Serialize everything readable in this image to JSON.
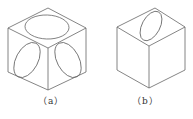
{
  "figure": {
    "panels": [
      {
        "id": "a",
        "label": "（a）",
        "description": "cube with circles inscribed on all three visible faces"
      },
      {
        "id": "b",
        "label": "（b）",
        "description": "cube with a tilted ellipse on top face"
      }
    ],
    "caption": "",
    "colors": {
      "line": "#555555",
      "background": "#ffffff"
    }
  }
}
